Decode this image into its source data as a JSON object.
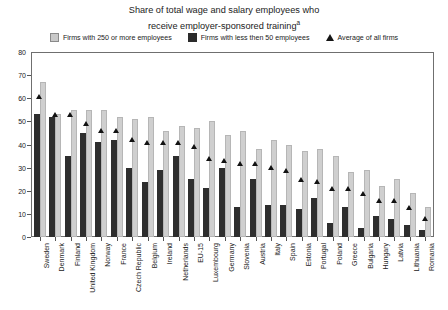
{
  "chart_data": {
    "type": "bar",
    "title": "Share of total wage and salary employees who receive employer-sponsored training",
    "title_line1": "Share of total wage and salary employees who",
    "title_line2": "receive employer-sponsored training",
    "title_superscript": "a",
    "xlabel": "",
    "ylabel": "",
    "ylim": [
      0,
      80
    ],
    "yticks": [
      0,
      10,
      20,
      30,
      40,
      50,
      60,
      70,
      80
    ],
    "grid": false,
    "legend_position": "top-center",
    "legend": [
      {
        "label": "Firms with 250 or more employees",
        "marker": "square",
        "color": "#c9c9c9"
      },
      {
        "label": "Firms with less then 50 employees",
        "marker": "square",
        "color": "#2b2b2b"
      },
      {
        "label": "Average of all firms",
        "marker": "triangle",
        "color": "#151515"
      }
    ],
    "categories": [
      "Sweden",
      "Denmark",
      "Finland",
      "United Kingdom",
      "Norway",
      "France",
      "Czech Republic",
      "Belgium",
      "Ireland",
      "Netherlands",
      "EU-15",
      "Luxembourg",
      "Germany",
      "Slovenia",
      "Austria",
      "Italy",
      "Spain",
      "Estonia",
      "Portugal",
      "Poland",
      "Greece",
      "Bulgaria",
      "Hungary",
      "Latvia",
      "Lithuania",
      "Romania"
    ],
    "series": [
      {
        "name": "Firms with less then 50 employees",
        "color": "#2e2e2e",
        "values": [
          53,
          52,
          35,
          45,
          41,
          42,
          30,
          24,
          29,
          35,
          25,
          21,
          30,
          13,
          25,
          14,
          14,
          12,
          17,
          6,
          13,
          4,
          9,
          8,
          5,
          3
        ]
      },
      {
        "name": "Firms with 250 or more employees",
        "color": "#cfcfcf",
        "values": [
          67,
          53,
          55,
          55,
          55,
          52,
          51,
          52,
          46,
          48,
          47,
          50,
          44,
          46,
          38,
          42,
          40,
          37,
          38,
          35,
          28,
          29,
          22,
          25,
          19,
          13
        ]
      }
    ],
    "average_series": {
      "name": "Average of all firms",
      "color": "#121212",
      "values": [
        61,
        53,
        53,
        49,
        46,
        46,
        42,
        41,
        41,
        41,
        39,
        34,
        33,
        32,
        32,
        30,
        29,
        25,
        24,
        21,
        21,
        19,
        16,
        16,
        13,
        8
      ]
    }
  }
}
